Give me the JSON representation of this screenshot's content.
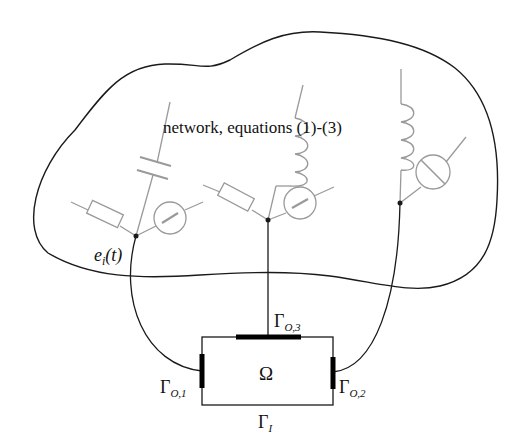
{
  "diagram": {
    "network_label": "network, equations (1)-(3)",
    "node_label": {
      "base": "e",
      "sub": "i",
      "arg": "(t)"
    },
    "domain_label": "Ω",
    "boundaries": [
      {
        "id": "gamma-o1",
        "base": "Γ",
        "sub": "O,1"
      },
      {
        "id": "gamma-o2",
        "base": "Γ",
        "sub": "O,2"
      },
      {
        "id": "gamma-o3",
        "base": "Γ",
        "sub": "O,3"
      },
      {
        "id": "gamma-i",
        "base": "Γ",
        "sub": "I"
      }
    ],
    "components": [
      {
        "branch": 1,
        "elements": [
          "resistor",
          "capacitor",
          "current-source"
        ]
      },
      {
        "branch": 2,
        "elements": [
          "resistor",
          "inductor",
          "current-source"
        ]
      },
      {
        "branch": 3,
        "elements": [
          "inductor",
          "current-source"
        ]
      }
    ],
    "colors": {
      "outline": "#1a1a1a",
      "component": "#9a9a9a",
      "bold_boundary": "#000000"
    }
  }
}
